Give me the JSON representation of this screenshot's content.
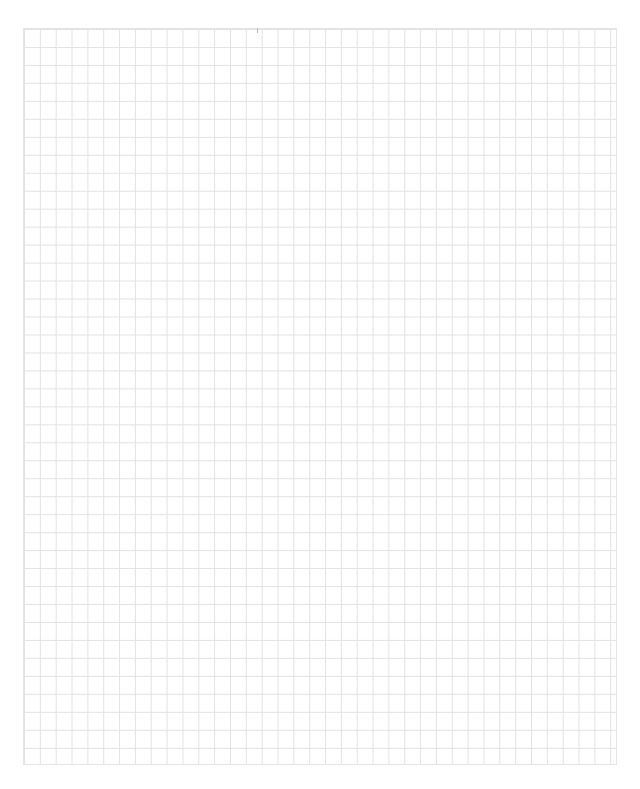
{
  "page": {
    "type": "blank grid paper",
    "grid": {
      "columns": 37,
      "rows": 41,
      "line_color": "#e2e2e2",
      "background": "#ffffff"
    }
  }
}
